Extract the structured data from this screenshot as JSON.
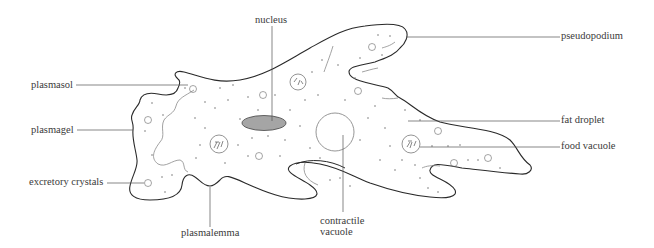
{
  "diagram": {
    "colors": {
      "outline": "#2a2a2a",
      "inner_line": "#8a8a8a",
      "nucleus_fill": "#9a9a9a",
      "label_text": "#3a3a3a",
      "leader_line": "#555555"
    },
    "labels": {
      "nucleus": "nucleus",
      "pseudopodium": "pseudopodium",
      "plasmasol": "plasmasol",
      "plasmagel": "plasmagel",
      "fat_droplet": "fat droplet",
      "food_vacuole": "food vacuole",
      "excretory_crystals": "excretory crystals",
      "plasmalemma": "plasmalemma",
      "contractile_vacuole_line1": "contractile",
      "contractile_vacuole_line2": "vacuole"
    }
  }
}
